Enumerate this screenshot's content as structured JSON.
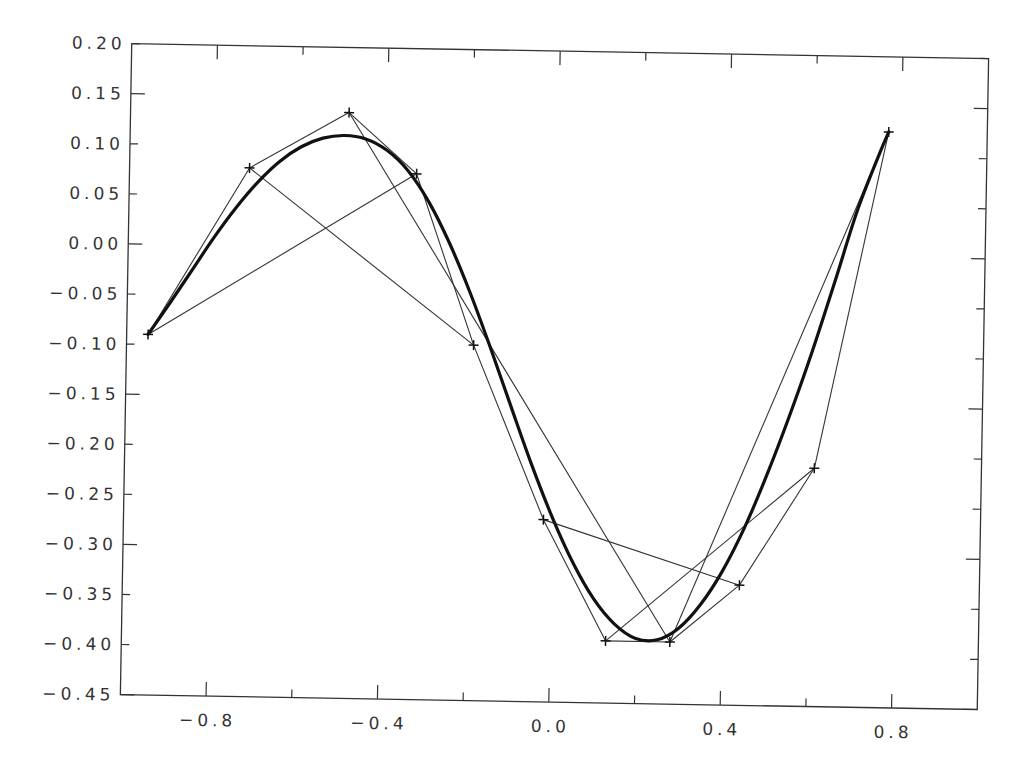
{
  "chart_data": {
    "type": "line",
    "title": "",
    "xlabel": "",
    "ylabel": "",
    "xlim": [
      -1.0,
      1.0
    ],
    "ylim": [
      -0.45,
      0.2
    ],
    "grid": false,
    "legend": null,
    "x_ticks": [
      -0.8,
      -0.4,
      0.0,
      0.4,
      0.8
    ],
    "x_tick_labels": [
      "-0.8",
      "-0.4",
      "0.0",
      "0.4",
      "0.8"
    ],
    "x_minor_ticks": [
      -0.6,
      -0.2,
      0.2,
      0.6
    ],
    "y_ticks": [
      0.2,
      0.15,
      0.1,
      0.05,
      0.0,
      -0.05,
      -0.1,
      -0.15,
      -0.2,
      -0.25,
      -0.3,
      -0.35,
      -0.4,
      -0.45
    ],
    "y_tick_labels": [
      "0.20",
      "0.15",
      "0.10",
      "0.05",
      "0.00",
      "-0.05",
      "-0.10",
      "-0.15",
      "-0.20",
      "-0.25",
      "-0.30",
      "-0.35",
      "-0.40",
      "-0.45"
    ],
    "control_points": {
      "name": "control points (+ markers)",
      "x": [
        -0.95,
        -0.72,
        -0.49,
        -0.33,
        -0.19,
        -0.02,
        0.13,
        0.28,
        0.44,
        0.61,
        0.77
      ],
      "y": [
        -0.09,
        0.078,
        0.135,
        0.075,
        -0.095,
        -0.268,
        -0.388,
        -0.388,
        -0.33,
        -0.212,
        0.125
      ]
    },
    "thin_segments": [
      [
        0,
        1
      ],
      [
        1,
        2
      ],
      [
        2,
        3
      ],
      [
        3,
        4
      ],
      [
        4,
        5
      ],
      [
        5,
        6
      ],
      [
        6,
        7
      ],
      [
        7,
        8
      ],
      [
        8,
        9
      ],
      [
        9,
        10
      ],
      [
        0,
        3
      ],
      [
        1,
        4
      ],
      [
        2,
        7
      ],
      [
        5,
        8
      ],
      [
        6,
        9
      ],
      [
        7,
        10
      ]
    ],
    "series": [
      {
        "name": "fitted curve (thick)",
        "x": [
          -0.95,
          -0.9,
          -0.85,
          -0.8,
          -0.75,
          -0.7,
          -0.65,
          -0.6,
          -0.55,
          -0.5,
          -0.45,
          -0.4,
          -0.35,
          -0.3,
          -0.25,
          -0.2,
          -0.15,
          -0.1,
          -0.05,
          0.0,
          0.05,
          0.1,
          0.15,
          0.2,
          0.25,
          0.3,
          0.35,
          0.4,
          0.45,
          0.5,
          0.55,
          0.6,
          0.65,
          0.7,
          0.75,
          0.77
        ],
        "y": [
          -0.09,
          -0.058,
          -0.025,
          0.008,
          0.038,
          0.064,
          0.085,
          0.1,
          0.109,
          0.112,
          0.109,
          0.098,
          0.078,
          0.047,
          0.006,
          -0.043,
          -0.098,
          -0.156,
          -0.213,
          -0.265,
          -0.31,
          -0.346,
          -0.371,
          -0.385,
          -0.386,
          -0.374,
          -0.35,
          -0.316,
          -0.272,
          -0.219,
          -0.16,
          -0.096,
          -0.026,
          0.046,
          0.104,
          0.125
        ]
      }
    ]
  },
  "colors": {
    "background": "#ffffff",
    "axes": "#333333",
    "curve": "#111111",
    "thin_lines": "#333333",
    "labels": "#333333"
  }
}
